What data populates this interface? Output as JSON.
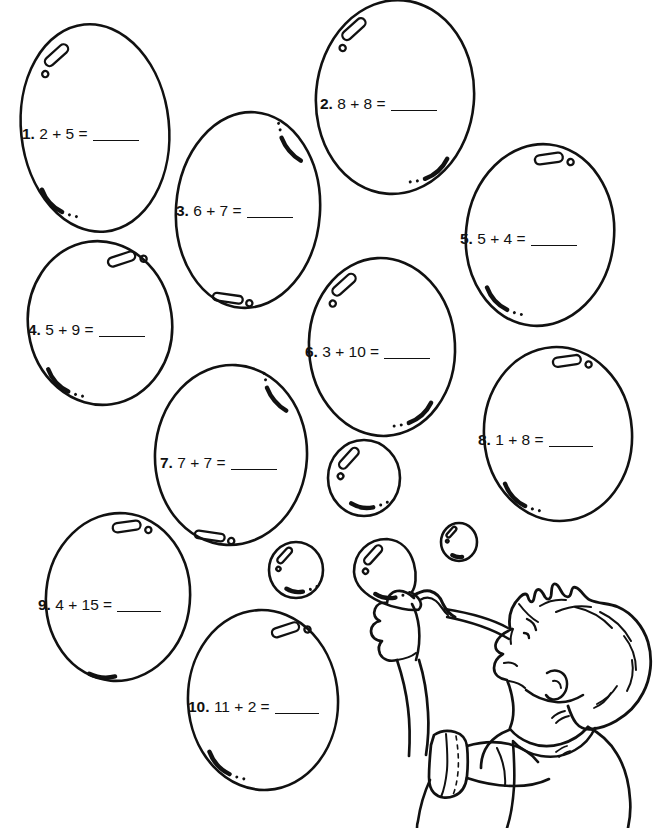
{
  "page": {
    "type": "math-worksheet",
    "theme": "bubbles",
    "line_color": "#111111",
    "background_color": "#ffffff"
  },
  "problems": [
    {
      "number": "1.",
      "expression": "2 + 5 =",
      "answer": "",
      "blank_width": 46,
      "x": 22,
      "y": 126,
      "bubble": {
        "cx": 95,
        "cy": 128,
        "rx": 74,
        "ry": 104,
        "rot": -6,
        "hi": "tl",
        "sh": "bl"
      }
    },
    {
      "number": "2.",
      "expression": "8 + 8 =",
      "answer": "",
      "blank_width": 46,
      "x": 320,
      "y": 96,
      "bubble": {
        "cx": 395,
        "cy": 97,
        "rx": 79,
        "ry": 97,
        "rot": 5,
        "hi": "tl",
        "sh": "br"
      }
    },
    {
      "number": "3.",
      "expression": "6 + 7 =",
      "answer": "",
      "blank_width": 46,
      "x": 176,
      "y": 203,
      "bubble": {
        "cx": 248,
        "cy": 210,
        "rx": 72,
        "ry": 98,
        "rot": 4,
        "hi": "tr-arc",
        "sh": "b-oval"
      }
    },
    {
      "number": "4.",
      "expression": "5 + 9 =",
      "answer": "",
      "blank_width": 46,
      "x": 28,
      "y": 322,
      "bubble": {
        "cx": 100,
        "cy": 323,
        "rx": 72,
        "ry": 82,
        "rot": -8,
        "hi": "tr",
        "sh": "bl"
      }
    },
    {
      "number": "5.",
      "expression": "5 + 4 =",
      "answer": "",
      "blank_width": 46,
      "x": 460,
      "y": 231,
      "bubble": {
        "cx": 540,
        "cy": 235,
        "rx": 74,
        "ry": 91,
        "rot": 6,
        "hi": "t",
        "sh": "bl"
      }
    },
    {
      "number": "6.",
      "expression": "3 + 10 =",
      "answer": "",
      "blank_width": 46,
      "x": 305,
      "y": 344,
      "bubble": {
        "cx": 382,
        "cy": 347,
        "rx": 73,
        "ry": 89,
        "rot": -3,
        "hi": "tl",
        "sh": "br"
      }
    },
    {
      "number": "7.",
      "expression": "7 + 7 =",
      "answer": "",
      "blank_width": 46,
      "x": 160,
      "y": 455,
      "bubble": {
        "cx": 231,
        "cy": 455,
        "rx": 76,
        "ry": 90,
        "rot": 3,
        "hi": "tr-arc",
        "sh": "b-oval"
      }
    },
    {
      "number": "8.",
      "expression": "1 + 8 =",
      "answer": "",
      "blank_width": 44,
      "x": 478,
      "y": 432,
      "bubble": {
        "cx": 558,
        "cy": 434,
        "rx": 74,
        "ry": 87,
        "rot": -4,
        "hi": "t",
        "sh": "bl"
      }
    },
    {
      "number": "9.",
      "expression": "4 + 15 =",
      "answer": "",
      "blank_width": 44,
      "x": 38,
      "y": 597,
      "bubble": {
        "cx": 118,
        "cy": 597,
        "rx": 72,
        "ry": 84,
        "rot": 5,
        "hi": "t",
        "sh": "b-short"
      }
    },
    {
      "number": "10.",
      "expression": "11 + 2 =",
      "answer": "",
      "blank_width": 44,
      "x": 188,
      "y": 699,
      "bubble": {
        "cx": 263,
        "cy": 700,
        "rx": 75,
        "ry": 90,
        "rot": -3,
        "hi": "tr",
        "sh": "bl"
      }
    }
  ],
  "decor_bubbles": [
    {
      "name": "small-bubble-center",
      "cx": 364,
      "cy": 478,
      "rx": 36,
      "ry": 38
    },
    {
      "name": "small-bubble-left",
      "cx": 296,
      "cy": 570,
      "rx": 27,
      "ry": 28
    },
    {
      "name": "small-bubble-right",
      "cx": 459,
      "cy": 542,
      "rx": 18,
      "ry": 19
    },
    {
      "name": "wand-bubble",
      "cx": 387,
      "cy": 572,
      "rx": 33,
      "ry": 33
    }
  ],
  "illustration": {
    "name": "boy-blowing-bubbles",
    "parts": [
      "hair",
      "face-profile",
      "ear",
      "fist-hand",
      "bubble-wand",
      "shirt",
      "rolled-sleeve",
      "collar"
    ]
  }
}
